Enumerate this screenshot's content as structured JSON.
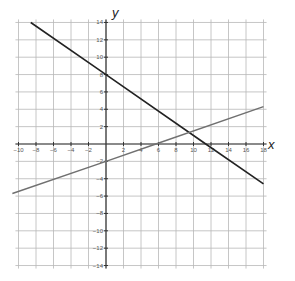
{
  "chart_data": {
    "type": "line",
    "title": "",
    "xlabel": "x",
    "ylabel": "y",
    "xlim": [
      -10,
      18
    ],
    "ylim": [
      -14,
      14
    ],
    "grid": true,
    "grid_step": 2,
    "x_ticks": [
      -10,
      -8,
      -6,
      -4,
      -2,
      2,
      4,
      6,
      8,
      10,
      12,
      14,
      16,
      18
    ],
    "y_ticks": [
      -14,
      -12,
      -10,
      -8,
      -6,
      -4,
      -2,
      2,
      4,
      6,
      8,
      10,
      12,
      14
    ],
    "series": [
      {
        "name": "line-1",
        "color": "#222222",
        "equation": "y = -0.7x + 8",
        "x": [
          -8.6,
          0,
          11.4,
          18
        ],
        "y": [
          14,
          8,
          0,
          -4.6
        ]
      },
      {
        "name": "line-2",
        "color": "#707070",
        "equation": "y = 0.35x - 2",
        "x": [
          -10.7,
          0,
          5.7,
          18
        ],
        "y": [
          -5.7,
          -2,
          0,
          4.3
        ]
      }
    ],
    "intersection": {
      "x": 9.5,
      "y": 1.33
    }
  },
  "labels": {
    "x_axis": "x",
    "y_axis": "y"
  }
}
